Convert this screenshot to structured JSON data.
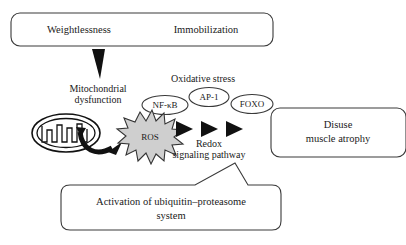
{
  "stimulus_box": {
    "left_label": "Weightlessness",
    "right_label": "Immobilization"
  },
  "mitochondrial_label": {
    "line1": "Mitochondrial",
    "line2": "dysfunction"
  },
  "oxidative_stress_label": "Oxidative stress",
  "transcription_factors": [
    {
      "name": "NF-κB"
    },
    {
      "name": "AP-1"
    },
    {
      "name": "FOXO"
    }
  ],
  "ros_node": {
    "label": "ROS"
  },
  "pathway_label": {
    "line1": "Redox",
    "line2": "signaling pathway"
  },
  "outcome_box": {
    "line1": "Disuse",
    "line2": "muscle atrophy"
  },
  "ubiquitin_box": {
    "line1": "Activation of ubiquitin–proteasome",
    "line2": "system"
  },
  "colors": {
    "background": "#ffffff",
    "outline": "#3a3a3a",
    "text": "#1a1a1a",
    "ros_fill": "#cfcfcf",
    "arrow_fill": "#111111"
  }
}
